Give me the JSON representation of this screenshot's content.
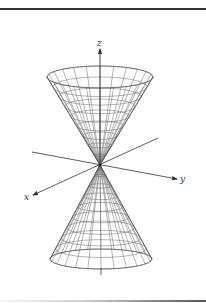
{
  "figure": {
    "axes": {
      "x_label": "x",
      "y_label": "y",
      "z_label": "z"
    },
    "colors": {
      "mesh": "#6b6b6b",
      "axis": "#333333",
      "rule": "#333333"
    },
    "geometry": {
      "apex": [
        100,
        165
      ],
      "top_cone": {
        "cx": 100,
        "rim_cy": 77,
        "rx": 53,
        "ry": 11,
        "rings": 9,
        "meridians": 24
      },
      "bottom_cone": {
        "cx": 101,
        "rim_cy": 259,
        "rx": 51,
        "ry": 10,
        "rings": 9,
        "meridians": 24
      },
      "z_axis": {
        "top": 49,
        "bottom_stub_from": 268,
        "bottom_stub_to": 275
      },
      "y_axis": {
        "from": [
          32,
          152
        ],
        "to": [
          177,
          179
        ]
      },
      "x_axis": {
        "from": [
          158,
          138
        ],
        "to": [
          33,
          195
        ]
      },
      "labels_pos": {
        "x": [
          24,
          200
        ],
        "y": [
          180,
          182
        ],
        "z": [
          97,
          46
        ]
      }
    }
  }
}
